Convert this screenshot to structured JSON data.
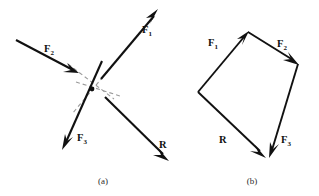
{
  "figure": {
    "background_color": "#ffffff",
    "ink_color": "#111111",
    "construction_color": "#9a9a9a",
    "panels": [
      {
        "id": "panel-a",
        "caption": "(a)",
        "caption_position": {
          "x": 103,
          "y": 183
        },
        "description": "Concurrent force system with action lines meeting at a point",
        "concurrency_point": {
          "x": 92,
          "y": 89
        },
        "vectors": [
          {
            "name": "F1",
            "label": "F",
            "subscript": "1",
            "label_position": {
              "x": 142,
              "y": 33
            },
            "tail": {
              "x": 103,
              "y": 77
            },
            "tip": {
              "x": 158,
              "y": 10
            },
            "direction": "up-right",
            "arrowhead": "solid"
          },
          {
            "name": "F2",
            "label": "F",
            "subscript": "2",
            "label_position": {
              "x": 44,
              "y": 52
            },
            "tail": {
              "x": 16,
              "y": 40
            },
            "tip": {
              "x": 77,
              "y": 72
            },
            "direction": "down-right",
            "arrowhead": "solid"
          },
          {
            "name": "F3",
            "label": "F",
            "subscript": "3",
            "label_position": {
              "x": 77,
              "y": 141
            },
            "tail": {
              "x": 101,
              "y": 62
            },
            "tip": {
              "x": 62,
              "y": 149
            },
            "direction": "down-left",
            "arrowhead": "solid"
          },
          {
            "name": "R",
            "label": "R",
            "subscript": "",
            "label_position": {
              "x": 160,
              "y": 148
            },
            "tail": {
              "x": 107,
              "y": 99
            },
            "tip": {
              "x": 168,
              "y": 160
            },
            "direction": "down-right",
            "arrowhead": "solid"
          }
        ],
        "construction_lines": [
          {
            "name": "extension-f2",
            "from": {
              "x": 70,
              "y": 66
            },
            "to": {
              "x": 112,
              "y": 98
            }
          },
          {
            "name": "extension-f1",
            "from": {
              "x": 110,
              "y": 68
            },
            "to": {
              "x": 74,
              "y": 112
            }
          },
          {
            "name": "extension-r",
            "from": {
              "x": 78,
              "y": 80
            },
            "to": {
              "x": 118,
              "y": 95
            }
          }
        ]
      },
      {
        "id": "panel-b",
        "caption": "(b)",
        "caption_position": {
          "x": 252,
          "y": 183
        },
        "description": "Force polygon: tip-to-tail addition of F1, F2, F3 giving resultant R",
        "vertices": [
          {
            "name": "origin-vertex",
            "x": 198,
            "y": 92
          },
          {
            "name": "top-vertex",
            "x": 248,
            "y": 32
          },
          {
            "name": "right-vertex",
            "x": 298,
            "y": 64
          },
          {
            "name": "bottom-vertex",
            "x": 268,
            "y": 158
          }
        ],
        "vectors": [
          {
            "name": "F1",
            "label": "F",
            "subscript": "1",
            "label_position": {
              "x": 214,
              "y": 45
            },
            "tail": {
              "x": 198,
              "y": 92
            },
            "tip": {
              "x": 248,
              "y": 32
            },
            "direction": "up-right",
            "arrowhead": "solid"
          },
          {
            "name": "F2",
            "label": "F",
            "subscript": "2",
            "label_position": {
              "x": 282,
              "y": 47
            },
            "tail": {
              "x": 248,
              "y": 32
            },
            "tip": {
              "x": 298,
              "y": 64
            },
            "direction": "down-right",
            "arrowhead": "solid"
          },
          {
            "name": "F3",
            "label": "F",
            "subscript": "3",
            "label_position": {
              "x": 280,
              "y": 142
            },
            "tail": {
              "x": 298,
              "y": 64
            },
            "tip": {
              "x": 270,
              "y": 157
            },
            "direction": "down-left",
            "arrowhead": "solid"
          },
          {
            "name": "R",
            "label": "R",
            "subscript": "",
            "label_position": {
              "x": 223,
              "y": 142
            },
            "tail": {
              "x": 198,
              "y": 92
            },
            "tip": {
              "x": 265,
              "y": 158
            },
            "direction": "down-right",
            "arrowhead": "solid"
          }
        ]
      }
    ]
  }
}
